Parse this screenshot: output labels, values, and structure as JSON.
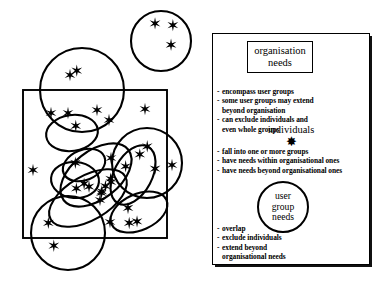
{
  "diagram": {
    "left_figure": {
      "name": "venn-style organisation diagram",
      "description": "A square representing the organisation, overlaid with circles and ellipses representing user groups, filled with star glyphs representing individuals.",
      "organisation_rect": {
        "x": 23,
        "y": 90,
        "width": 144,
        "height": 148
      },
      "star_glyph": "✸",
      "groups": [
        {
          "name": "group-top-right-outside",
          "cx": 161,
          "cy": 41,
          "rx": 30,
          "ry": 30,
          "rot": 0,
          "stars": 3
        },
        {
          "name": "group-top-large",
          "cx": 82,
          "cy": 90,
          "rx": 42,
          "ry": 42,
          "rot": 0,
          "stars": 1
        },
        {
          "name": "group-bottom-left",
          "cx": 68,
          "cy": 233,
          "rx": 37,
          "ry": 37,
          "rot": 0,
          "stars": 2
        },
        {
          "name": "group-right-upper",
          "cx": 147,
          "cy": 163,
          "rx": 35,
          "ry": 35,
          "rot": 0,
          "stars": 2
        },
        {
          "name": "group-mid-left-small",
          "cx": 72,
          "cy": 133,
          "rx": 26,
          "ry": 18,
          "rot": -8,
          "stars": 1
        },
        {
          "name": "group-mid-core",
          "cx": 84,
          "cy": 165,
          "rx": 22,
          "ry": 15,
          "rot": -22,
          "stars": 1
        },
        {
          "name": "group-mid-lower-small",
          "cx": 75,
          "cy": 180,
          "rx": 24,
          "ry": 18,
          "rot": 5,
          "stars": 2
        },
        {
          "name": "group-centre-diagonal",
          "cx": 96,
          "cy": 175,
          "rx": 41,
          "ry": 24,
          "rot": -38,
          "stars": 3
        },
        {
          "name": "group-left-diagonal",
          "cx": 88,
          "cy": 198,
          "rx": 43,
          "ry": 22,
          "rot": -30,
          "stars": 2
        },
        {
          "name": "group-right-tilted",
          "cx": 133,
          "cy": 175,
          "rx": 32,
          "ry": 19,
          "rot": -62,
          "stars": 2
        },
        {
          "name": "group-right-lower-tilted",
          "cx": 139,
          "cy": 212,
          "rx": 30,
          "ry": 18,
          "rot": -24,
          "stars": 3
        }
      ],
      "loose_stars": [
        {
          "x": 33,
          "y": 170
        },
        {
          "x": 51,
          "y": 113
        },
        {
          "x": 68,
          "y": 113
        },
        {
          "x": 97,
          "y": 110
        },
        {
          "x": 109,
          "y": 120
        },
        {
          "x": 145,
          "y": 109
        },
        {
          "x": 70,
          "y": 75
        },
        {
          "x": 111,
          "y": 182
        },
        {
          "x": 111,
          "y": 158
        },
        {
          "x": 100,
          "y": 200
        },
        {
          "x": 110,
          "y": 222
        },
        {
          "x": 172,
          "y": 165
        }
      ]
    },
    "panel": {
      "organisation": {
        "heading": "organisation\nneeds",
        "heading_line1": "organisation",
        "heading_line2": "needs",
        "bullets": [
          {
            "lines": [
              "encompass user groups"
            ]
          },
          {
            "lines": [
              "some user groups may extend",
              "beyond organisation"
            ]
          },
          {
            "lines": [
              "can exclude individuals and",
              "even whole groups"
            ]
          }
        ]
      },
      "individuals": {
        "heading": "individuals",
        "star_glyph": "✸",
        "bullets": [
          {
            "lines": [
              "fall into one or more groups"
            ]
          },
          {
            "lines": [
              "have needs within organisational ones"
            ]
          },
          {
            "lines": [
              "have needs beyond organisational ones"
            ]
          }
        ]
      },
      "user_group_needs": {
        "heading_line1": "user",
        "heading_line2": "group",
        "heading_line3": "needs",
        "bullets": [
          {
            "lines": [
              "overlap"
            ]
          },
          {
            "lines": [
              "exclude individuals"
            ]
          },
          {
            "lines": [
              "extend beyond",
              "organisational needs"
            ]
          }
        ]
      },
      "bullet_marker": "-"
    }
  },
  "colors": {
    "ink": "#000000",
    "background": "#ffffff"
  }
}
